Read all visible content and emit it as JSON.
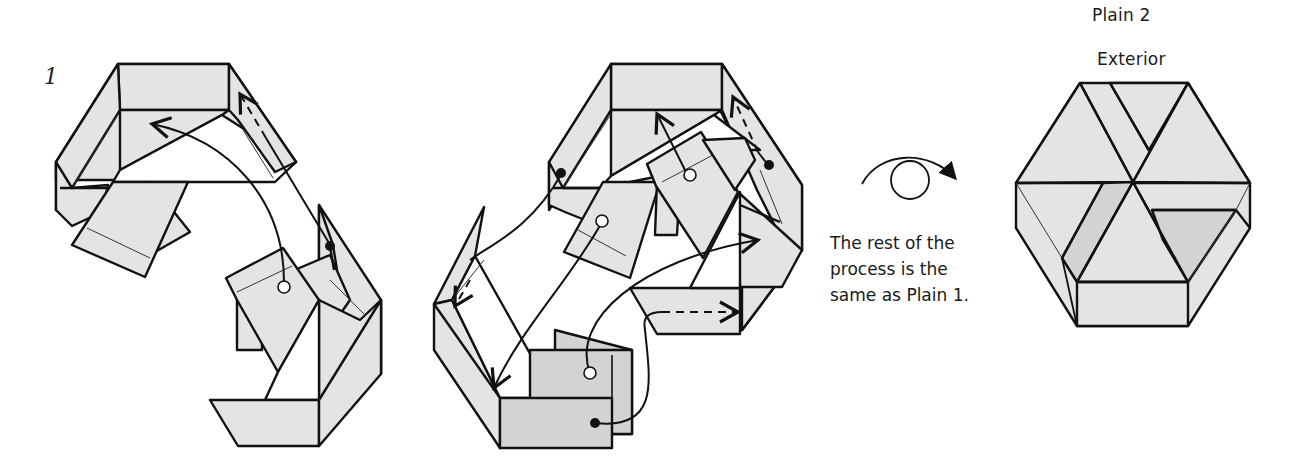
{
  "step": {
    "number": "1"
  },
  "labels": {
    "title": "Plain 2",
    "subtitle": "Exterior"
  },
  "note": {
    "lines": [
      "The rest of the",
      "process is the",
      "same as Plain 1."
    ]
  },
  "symbols": {
    "turn_over": "turn-over-icon",
    "push_in_arrow": "arrow-icon",
    "insert_marker_open": "open-circle-marker",
    "insert_marker_filled": "filled-circle-marker"
  },
  "colors": {
    "paper_light": "#e4e4e4",
    "paper_dark": "#d3d3d3",
    "line": "#111111",
    "background": "#ffffff"
  },
  "figures": [
    {
      "id": "figure-step-1-left",
      "description": "Partially assembled hexagonal box with two flaps being inserted"
    },
    {
      "id": "figure-step-1-middle",
      "description": "Hexagonal box assembly with multiple insertion arrows"
    },
    {
      "id": "figure-result-exterior",
      "description": "Completed hexagonal lid, exterior view"
    }
  ]
}
